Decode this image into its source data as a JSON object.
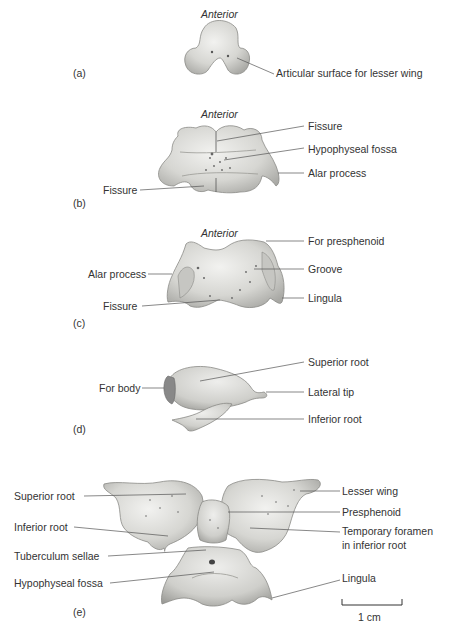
{
  "figure": {
    "panels": [
      {
        "id": "a",
        "panel_label": "(a)",
        "orientation": "Anterior",
        "labels": [
          "Articular surface for lesser wing"
        ]
      },
      {
        "id": "b",
        "panel_label": "(b)",
        "orientation": "Anterior",
        "labels": [
          "Fissure",
          "Hypophyseal fossa",
          "Alar process",
          "Fissure"
        ]
      },
      {
        "id": "c",
        "panel_label": "(c)",
        "orientation": "Anterior",
        "labels": [
          "For presphenoid",
          "Groove",
          "Lingula",
          "Alar process",
          "Fissure"
        ]
      },
      {
        "id": "d",
        "panel_label": "(d)",
        "labels": [
          "Superior root",
          "Lateral tip",
          "Inferior root",
          "For body"
        ]
      },
      {
        "id": "e",
        "panel_label": "(e)",
        "labels": [
          "Superior root",
          "Inferior root",
          "Tuberculum sellae",
          "Hypophyseal fossa",
          "Lesser wing",
          "Presphenoid",
          "Temporary foramen",
          "in inferior root",
          "Lingula"
        ]
      }
    ],
    "scale_bar": {
      "label": "1 cm"
    },
    "colors": {
      "bone_fill": "#d9d9d6",
      "bone_shadow": "#a9a9a5",
      "leader_line": "#555555",
      "text": "#333333"
    }
  }
}
